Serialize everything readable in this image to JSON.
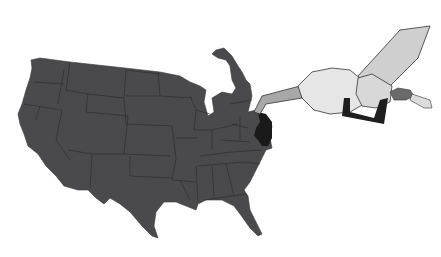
{
  "illustration": {
    "subject": "US map with gas pump nozzle",
    "colors": {
      "background": "#ffffff",
      "map_fill": "#4a4a4c",
      "state_border": "#2a2a2a",
      "highlight_region": "#1a1a1a",
      "glove": "#e6e6e6",
      "arm": "#cfcfcf",
      "nozzle_spout": "#a8a8a8",
      "handle": "#1e1e1e",
      "hose": "#6a6a6a"
    }
  }
}
